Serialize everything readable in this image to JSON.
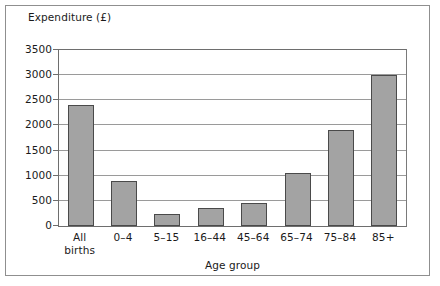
{
  "chart_data": {
    "type": "bar",
    "title": "",
    "xlabel": "Age group",
    "ylabel": "Expenditure (£)",
    "categories": [
      "All births",
      "0–4",
      "5–15",
      "16–44",
      "45–64",
      "65–74",
      "75–84",
      "85+"
    ],
    "values": [
      2400,
      900,
      230,
      360,
      460,
      1050,
      1900,
      3000
    ],
    "ylim": [
      0,
      3500
    ],
    "yticks": [
      0,
      500,
      1000,
      1500,
      2000,
      2500,
      3000,
      3500
    ],
    "ytick_labels": [
      "0",
      "500",
      "1000",
      "1500",
      "2000",
      "2500",
      "3000",
      "3500"
    ],
    "grid": true,
    "legend": false,
    "bar_color": "#a3a3a3",
    "bar_edge_color": "#4a4a4a",
    "gridline_color": "#9a9a9a",
    "axis_color": "#6e6e6e",
    "frame_color": "#8f8f8f",
    "text_color": "#1a1a1a"
  },
  "axes": {
    "y_title": "Expenditure (£)",
    "x_title": "Age group"
  },
  "category_labels": [
    {
      "line1": "All",
      "line2": "births"
    },
    {
      "line1": "0–4",
      "line2": ""
    },
    {
      "line1": "5–15",
      "line2": ""
    },
    {
      "line1": "16–44",
      "line2": ""
    },
    {
      "line1": "45–64",
      "line2": ""
    },
    {
      "line1": "65–74",
      "line2": ""
    },
    {
      "line1": "75–84",
      "line2": ""
    },
    {
      "line1": "85+",
      "line2": ""
    }
  ]
}
